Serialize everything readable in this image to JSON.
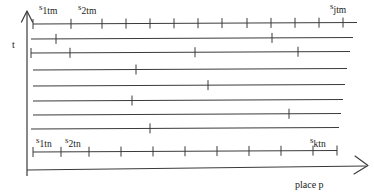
{
  "figure": {
    "kind": "timing-diagram",
    "background": "#ffffff",
    "stroke_color": "#3a3a3a",
    "text_color": "#1a1a1a",
    "width": 374,
    "height": 193
  },
  "axes": {
    "vertical": {
      "name": "t-axis",
      "label": "t",
      "label_x": 12,
      "label_y": 40,
      "arrow": "up",
      "x": 27,
      "y_top": 12,
      "y_bottom": 176
    },
    "horizontal": {
      "name": "place-axis",
      "label": "place p",
      "label_x": 295,
      "label_y": 180,
      "arrow": "right",
      "y": 170,
      "x_left": 27,
      "x_right": 366
    }
  },
  "labels": [
    {
      "id": "s1tm",
      "sup": "s",
      "sub": "1tm",
      "x": 39,
      "y": 3,
      "name": "label-s1tm"
    },
    {
      "id": "s2tm",
      "sup": "s",
      "sub": "2tm",
      "x": 78,
      "y": 3,
      "name": "label-s2tm"
    },
    {
      "id": "sjtm",
      "sup": "s",
      "sub": "jtm",
      "x": 330,
      "y": 2,
      "name": "label-sjtm"
    },
    {
      "id": "s1tn",
      "sup": "s",
      "sub": "1tn",
      "x": 36,
      "y": 136,
      "name": "label-s1tn"
    },
    {
      "id": "s2tn",
      "sup": "s",
      "sub": "2tn",
      "x": 65,
      "y": 136,
      "name": "label-s2tn"
    },
    {
      "id": "sktn",
      "sup": "s",
      "sub": "ktn",
      "x": 310,
      "y": 136,
      "name": "label-sktn"
    }
  ],
  "chart_data": {
    "type": "line",
    "title": "",
    "xlabel": "place p",
    "ylabel": "t",
    "rows": [
      {
        "index": 0,
        "y": 24,
        "x_start": 33,
        "x_end": 357,
        "ticks": [
          33,
          71,
          102,
          126,
          150,
          174,
          198,
          222,
          247,
          271,
          295,
          319,
          343
        ]
      },
      {
        "index": 1,
        "y": 39,
        "x_start": 31,
        "x_end": 353,
        "ticks": [
          56,
          272
        ]
      },
      {
        "index": 2,
        "y": 53,
        "x_start": 31,
        "x_end": 350,
        "ticks": [
          31,
          70,
          195,
          298
        ]
      },
      {
        "index": 3,
        "y": 70,
        "x_start": 33,
        "x_end": 347,
        "ticks": [
          136
        ]
      },
      {
        "index": 4,
        "y": 86,
        "x_start": 33,
        "x_end": 345,
        "ticks": [
          208
        ]
      },
      {
        "index": 5,
        "y": 101,
        "x_start": 33,
        "x_end": 343,
        "ticks": [
          132
        ]
      },
      {
        "index": 6,
        "y": 115,
        "x_start": 33,
        "x_end": 341,
        "ticks": [
          289
        ]
      },
      {
        "index": 7,
        "y": 129,
        "x_start": 31,
        "x_end": 339,
        "ticks": [
          150
        ]
      },
      {
        "index": 8,
        "y": 152,
        "x_start": 33,
        "x_end": 337,
        "ticks": [
          33,
          61,
          89,
          121,
          153,
          185,
          217,
          249,
          281,
          313,
          337
        ]
      }
    ],
    "frame": {
      "left_x": 27,
      "top_y": 12,
      "bottom_y": 170
    }
  }
}
